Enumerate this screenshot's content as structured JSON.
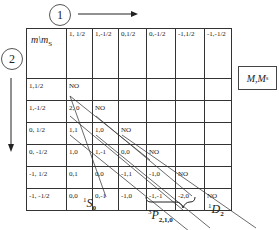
{
  "arrows": {
    "step1_label": "1",
    "step2_label": "2"
  },
  "table": {
    "corner": {
      "m": "m",
      "sep": "\\m",
      "s_sub": "S"
    },
    "columns": [
      "1, 1/2",
      "1,-1/2",
      "0,1/2",
      "0,-1/2",
      "-1,1/2",
      "-1,-1/2"
    ],
    "rows": [
      {
        "label": "1,1/2",
        "cells": [
          "NO",
          "",
          "",
          "",
          "",
          ""
        ]
      },
      {
        "label": "1,-1/2",
        "cells": [
          "2, 0",
          "NO",
          "",
          "",
          "",
          ""
        ]
      },
      {
        "label": "0, 1/2",
        "cells": [
          "1,1",
          "1,0",
          "NO",
          "",
          "",
          ""
        ]
      },
      {
        "label": "0, -1/2",
        "cells": [
          "1,0",
          "1,-1",
          "0,0",
          "NO",
          "",
          ""
        ]
      },
      {
        "label": "-1, 1/2",
        "cells": [
          "0,1",
          "0,0",
          "-1,1",
          "-1,0",
          "NO",
          ""
        ]
      },
      {
        "label": "-1, -1/2",
        "cells": [
          "0,0",
          "0,-1",
          "-1,0",
          "-1,-1",
          "-2,0",
          "NO"
        ]
      }
    ]
  },
  "legend_box": {
    "main": "M",
    "sep": ",M",
    "sub": "s"
  },
  "terms": {
    "s0": {
      "sup": "1",
      "letter": "S",
      "sub": "0"
    },
    "p": {
      "sup": "3",
      "letter": "P",
      "sub": "2,1,0"
    },
    "d2": {
      "sup": "1",
      "letter": "D",
      "sub": "2"
    }
  }
}
